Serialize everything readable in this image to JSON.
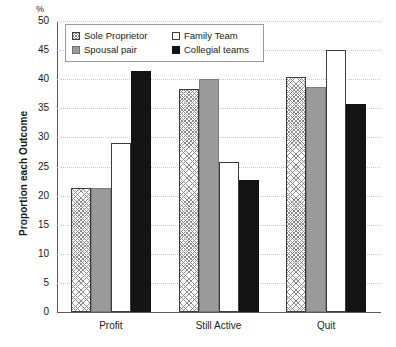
{
  "chart_data": {
    "type": "bar",
    "title": "",
    "subtitle": "",
    "xlabel": "",
    "ylabel": "Proportion each Outcome",
    "unit_label": "%",
    "categories": [
      "Profit",
      "Still Active",
      "Quit"
    ],
    "series": [
      {
        "name": "Sole Proprietor",
        "values": [
          21.3,
          38.3,
          40.3
        ],
        "swatch": "hatched-light"
      },
      {
        "name": "Family Team",
        "values": [
          29.1,
          25.8,
          45.1
        ],
        "swatch": "white"
      },
      {
        "name": "Spousal pair",
        "values": [
          21.3,
          40.1,
          38.6
        ],
        "swatch": "gray"
      },
      {
        "name": "Collegial teams",
        "values": [
          41.4,
          22.7,
          35.8
        ],
        "swatch": "black"
      }
    ],
    "legend_order": [
      "Sole Proprietor",
      "Family Team",
      "Spousal pair",
      "Collegial teams"
    ],
    "bar_draw_order": [
      "Sole Proprietor",
      "Spousal pair",
      "Family Team",
      "Collegial teams"
    ],
    "ylim": [
      0,
      50
    ],
    "ytick_step": 5,
    "yticks": [
      "0",
      "5",
      "10",
      "15",
      "20",
      "25",
      "30",
      "35",
      "40",
      "45",
      "50"
    ],
    "grid": true,
    "grid_axis": "y",
    "legend_position": "upper-left-inside",
    "colors": {
      "gray_fill": "#9a9a9a",
      "black_fill": "#141414",
      "white_fill": "#ffffff",
      "outline": "#3c3c3c",
      "gridline": "#c9c9c9",
      "axis": "#5a5a5a",
      "text": "#1a1a1a"
    }
  }
}
